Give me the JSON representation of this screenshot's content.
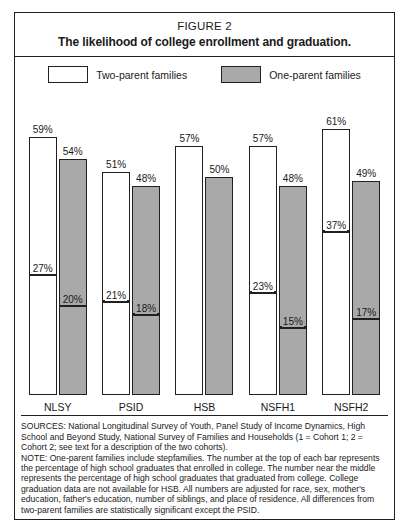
{
  "figure": {
    "number": "FIGURE 2",
    "title": "The likelihood of college enrollment and graduation."
  },
  "legend": {
    "items": [
      {
        "label": "Two-parent families",
        "swatch": "white-square-icon",
        "color": "#ffffff"
      },
      {
        "label": "One-parent families",
        "swatch": "gray-square-icon",
        "color": "#a9a9a9"
      }
    ]
  },
  "footnotes": {
    "sources": "SOURCES: National Longitudinal Survey of Youth, Panel Study of Income Dynamics, High School and Beyond Study, National Survey of Families and Households (1 = Cohort 1; 2 = Cohort 2; see text for a description of the two cohorts).",
    "note": "NOTE: One-parent families include stepfamilies. The number at the top of each bar represents the percentage of high school graduates that enrolled in college. The number near the middle represents the percentage of high school graduates that graduated from college. College graduation data are not available for HSB. All numbers are adjusted for race, sex, mother's education, father's education, number of siblings, and place of residence. All differences from two-parent families are statistically significant except the PSID."
  },
  "chart_data": {
    "type": "bar",
    "title": "The likelihood of college enrollment and graduation.",
    "subtitle": "FIGURE 2",
    "xlabel": "",
    "ylabel": "",
    "ylim": [
      0,
      70
    ],
    "grid": false,
    "legend_position": "top",
    "categories": [
      "NLSY",
      "PSID",
      "HSB",
      "NSFH1",
      "NSFH2"
    ],
    "series": [
      {
        "name": "Two-parent families",
        "color": "#ffffff",
        "metric": "enrolled in college (%)",
        "values": [
          59,
          51,
          57,
          57,
          61
        ],
        "value_labels": [
          "59%",
          "51%",
          "57%",
          "57%",
          "61%"
        ]
      },
      {
        "name": "One-parent families",
        "color": "#a9a9a9",
        "metric": "enrolled in college (%)",
        "values": [
          54,
          48,
          50,
          48,
          49
        ],
        "value_labels": [
          "54%",
          "48%",
          "50%",
          "48%",
          "49%"
        ]
      },
      {
        "name": "Two-parent families (graduated)",
        "color": "#ffffff",
        "metric": "graduated from college (%)",
        "values": [
          27,
          21,
          null,
          23,
          37
        ],
        "value_labels": [
          "27%",
          "21%",
          "",
          "23%",
          "37%"
        ]
      },
      {
        "name": "One-parent families (graduated)",
        "color": "#a9a9a9",
        "metric": "graduated from college (%)",
        "values": [
          20,
          18,
          null,
          15,
          17
        ],
        "value_labels": [
          "20%",
          "18%",
          "",
          "15%",
          "17%"
        ]
      }
    ],
    "groups": [
      {
        "category": "NLSY",
        "bars": [
          {
            "series": "Two-parent families",
            "enrolled": 59,
            "enrolled_label": "59%",
            "graduated": 27,
            "graduated_label": "27%"
          },
          {
            "series": "One-parent families",
            "enrolled": 54,
            "enrolled_label": "54%",
            "graduated": 20,
            "graduated_label": "20%"
          }
        ]
      },
      {
        "category": "PSID",
        "bars": [
          {
            "series": "Two-parent families",
            "enrolled": 51,
            "enrolled_label": "51%",
            "graduated": 21,
            "graduated_label": "21%"
          },
          {
            "series": "One-parent families",
            "enrolled": 48,
            "enrolled_label": "48%",
            "graduated": 18,
            "graduated_label": "18%"
          }
        ]
      },
      {
        "category": "HSB",
        "bars": [
          {
            "series": "Two-parent families",
            "enrolled": 57,
            "enrolled_label": "57%",
            "graduated": null,
            "graduated_label": ""
          },
          {
            "series": "One-parent families",
            "enrolled": 50,
            "enrolled_label": "50%",
            "graduated": null,
            "graduated_label": ""
          }
        ]
      },
      {
        "category": "NSFH1",
        "bars": [
          {
            "series": "Two-parent families",
            "enrolled": 57,
            "enrolled_label": "57%",
            "graduated": 23,
            "graduated_label": "23%"
          },
          {
            "series": "One-parent families",
            "enrolled": 48,
            "enrolled_label": "48%",
            "graduated": 15,
            "graduated_label": "15%"
          }
        ]
      },
      {
        "category": "NSFH2",
        "bars": [
          {
            "series": "Two-parent families",
            "enrolled": 61,
            "enrolled_label": "61%",
            "graduated": 37,
            "graduated_label": "37%"
          },
          {
            "series": "One-parent families",
            "enrolled": 49,
            "enrolled_label": "49%",
            "graduated": 17,
            "graduated_label": "17%"
          }
        ]
      }
    ]
  }
}
